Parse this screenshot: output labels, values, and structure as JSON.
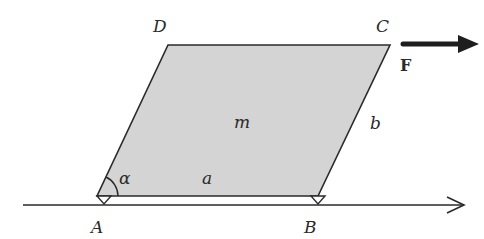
{
  "diagram": {
    "title": "",
    "colors": {
      "fill": "#d4d4d4",
      "stroke": "#2a2a2a",
      "background": "#ffffff"
    },
    "vertices": {
      "A": {
        "label": "A",
        "x": 97,
        "y": 196
      },
      "B": {
        "label": "B",
        "x": 318,
        "y": 196
      },
      "C": {
        "label": "C",
        "x": 390,
        "y": 45
      },
      "D": {
        "label": "D",
        "x": 168,
        "y": 45
      }
    },
    "labels": {
      "vertex_a": "A",
      "vertex_b": "B",
      "vertex_c": "C",
      "vertex_d": "D",
      "mass": "m",
      "side_a": "a",
      "side_b": "b",
      "angle": "α",
      "force": "F"
    },
    "ground_axis": {
      "x1": 23,
      "x2": 465,
      "y": 205,
      "direction": "right"
    },
    "force_arrow": {
      "x1": 403,
      "x2": 478,
      "y": 44,
      "label": "F"
    }
  }
}
